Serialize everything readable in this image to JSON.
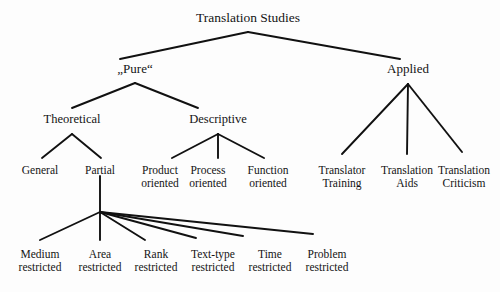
{
  "diagram": {
    "title": "Translation Studies",
    "type": "hierarchy-tree",
    "line_color": "#111111",
    "background_color": "#fdfdfd",
    "text_color": "#141414",
    "nodes": {
      "root": {
        "label": "Translation Studies",
        "x": 248,
        "y": 10
      },
      "pure": {
        "label": "„Pure“",
        "x": 135,
        "y": 62
      },
      "applied": {
        "label": "Applied",
        "x": 408,
        "y": 62
      },
      "theoretical": {
        "label": "Theoretical",
        "x": 72,
        "y": 112
      },
      "descriptive": {
        "label": "Descriptive",
        "x": 218,
        "y": 112
      },
      "general": {
        "label": "General",
        "x": 40,
        "y": 164
      },
      "partial": {
        "label": "Partial",
        "x": 100,
        "y": 164
      },
      "product_oriented": {
        "label": "Product",
        "line2": "oriented",
        "x": 160,
        "y": 164
      },
      "process_oriented": {
        "label": "Process",
        "line2": "oriented",
        "x": 208,
        "y": 164
      },
      "function_oriented": {
        "label": "Function",
        "line2": "oriented",
        "x": 268,
        "y": 164
      },
      "translator_training": {
        "label": "Translator",
        "line2": "Training",
        "x": 342,
        "y": 164
      },
      "translation_aids": {
        "label": "Translation",
        "line2": "Aids",
        "x": 407,
        "y": 164
      },
      "translation_criticism": {
        "label": "Translation",
        "line2": "Criticism",
        "x": 464,
        "y": 164
      },
      "medium_restricted": {
        "label": "Medium",
        "line2": "restricted",
        "x": 40,
        "y": 248
      },
      "area_restricted": {
        "label": "Area",
        "line2": "restricted",
        "x": 100,
        "y": 248
      },
      "rank_restricted": {
        "label": "Rank",
        "line2": "restricted",
        "x": 156,
        "y": 248
      },
      "text_type_restricted": {
        "label": "Text-type",
        "line2": "restricted",
        "x": 213,
        "y": 248
      },
      "time_restricted": {
        "label": "Time",
        "line2": "restricted",
        "x": 270,
        "y": 248
      },
      "problem_restricted": {
        "label": "Problem",
        "line2": "restricted",
        "x": 327,
        "y": 248
      }
    },
    "edges": [
      {
        "name": "root-to-pure",
        "x1": 248,
        "y1": 32,
        "x2": 120,
        "y2": 59
      },
      {
        "name": "root-to-applied",
        "x1": 248,
        "y1": 32,
        "x2": 400,
        "y2": 59
      },
      {
        "name": "pure-to-theoretical",
        "x1": 135,
        "y1": 83,
        "x2": 72,
        "y2": 108
      },
      {
        "name": "pure-to-descriptive",
        "x1": 135,
        "y1": 83,
        "x2": 198,
        "y2": 108
      },
      {
        "name": "theoretical-to-general",
        "x1": 72,
        "y1": 134,
        "x2": 42,
        "y2": 158
      },
      {
        "name": "theoretical-to-partial",
        "x1": 72,
        "y1": 134,
        "x2": 101,
        "y2": 158
      },
      {
        "name": "descriptive-to-product",
        "x1": 218,
        "y1": 134,
        "x2": 172,
        "y2": 158
      },
      {
        "name": "descriptive-to-process",
        "x1": 218,
        "y1": 134,
        "x2": 218,
        "y2": 158
      },
      {
        "name": "descriptive-to-function",
        "x1": 218,
        "y1": 134,
        "x2": 264,
        "y2": 158
      },
      {
        "name": "applied-to-translator-training",
        "x1": 408,
        "y1": 84,
        "x2": 342,
        "y2": 154
      },
      {
        "name": "applied-to-translation-aids",
        "x1": 408,
        "y1": 84,
        "x2": 407,
        "y2": 154
      },
      {
        "name": "applied-to-translation-criticism",
        "x1": 408,
        "y1": 84,
        "x2": 462,
        "y2": 152
      },
      {
        "name": "partial-stem",
        "x1": 100,
        "y1": 176,
        "x2": 100,
        "y2": 212
      },
      {
        "name": "partial-to-medium",
        "x1": 100,
        "y1": 212,
        "x2": 40,
        "y2": 240
      },
      {
        "name": "partial-to-area",
        "x1": 100,
        "y1": 212,
        "x2": 100,
        "y2": 240
      },
      {
        "name": "partial-to-rank",
        "x1": 100,
        "y1": 212,
        "x2": 145,
        "y2": 240
      },
      {
        "name": "partial-to-text-type",
        "x1": 100,
        "y1": 212,
        "x2": 196,
        "y2": 238
      },
      {
        "name": "partial-to-time",
        "x1": 100,
        "y1": 212,
        "x2": 243,
        "y2": 236
      },
      {
        "name": "partial-to-problem",
        "x1": 100,
        "y1": 212,
        "x2": 313,
        "y2": 234
      }
    ]
  }
}
